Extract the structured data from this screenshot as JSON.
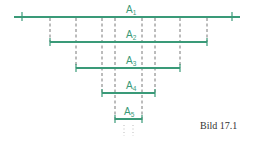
{
  "diagram": {
    "caption": "Bild 17.1",
    "colors": {
      "segment": "#3a9a78",
      "guides": "#555555"
    },
    "segments": [
      {
        "label": "A",
        "sub": "1"
      },
      {
        "label": "A",
        "sub": "2"
      },
      {
        "label": "A",
        "sub": "3"
      },
      {
        "label": "A",
        "sub": "4"
      },
      {
        "label": "A",
        "sub": "5"
      }
    ],
    "continuation": ": :"
  }
}
